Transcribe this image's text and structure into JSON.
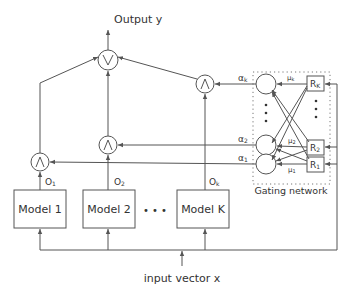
{
  "diagram": {
    "output_label": "Output y",
    "input_label": "input vector x",
    "gating_label": "Gating network",
    "combiner_symbol": "∨",
    "gate_symbol": "∧",
    "models": [
      {
        "label": "Model 1",
        "output": "O1",
        "output_main": "O",
        "output_sub": "1"
      },
      {
        "label": "Model 2",
        "output": "O2",
        "output_main": "O",
        "output_sub": "2"
      },
      {
        "label": "Model K",
        "output": "Ok",
        "output_main": "O",
        "output_sub": "k"
      }
    ],
    "ellipsis": "• • •",
    "gating": {
      "alphas": [
        {
          "main": "α",
          "sub": "k"
        },
        {
          "main": "α",
          "sub": "2"
        },
        {
          "main": "α",
          "sub": "1"
        }
      ],
      "mus": [
        {
          "main": "μ",
          "sub": "k"
        },
        {
          "main": "μ",
          "sub": "2"
        },
        {
          "main": "μ",
          "sub": "1"
        }
      ],
      "regressors": [
        {
          "main": "R",
          "sub": "K"
        },
        {
          "main": "R",
          "sub": "2"
        },
        {
          "main": "R",
          "sub": "1"
        }
      ]
    }
  }
}
